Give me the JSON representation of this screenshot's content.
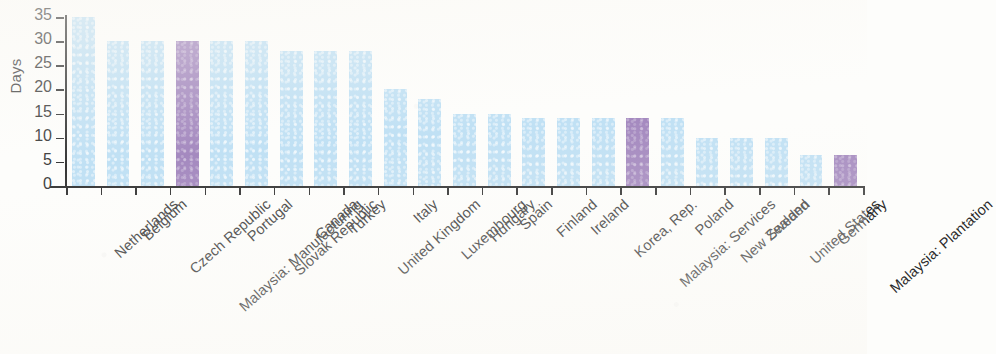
{
  "chart_data": {
    "type": "bar",
    "title": "",
    "subtitle": "",
    "xlabel": "",
    "ylabel": "Days",
    "ylim": [
      0,
      35
    ],
    "yticks": [
      0,
      5,
      10,
      15,
      20,
      25,
      30,
      35
    ],
    "ytick_labels": [
      "0",
      "5",
      "10",
      "15",
      "20",
      "25",
      "30",
      "35"
    ],
    "grid": false,
    "legend": "none",
    "categories": [
      "Netherlands",
      "Belgium",
      "Czech Republic",
      "Malaysia: Manufacturing",
      "Portugal",
      "Slovak Republic",
      "Canada",
      "Turkey",
      "United Kingdom",
      "Italy",
      "Luxembourg",
      "Hungary",
      "Spain",
      "Finland",
      "Ireland",
      "Korea, Rep.",
      "Malaysia: Services",
      "Poland",
      "New Zealand",
      "Sweden",
      "United States",
      "Germany",
      "Malaysia: Plantation"
    ],
    "values": [
      35,
      30,
      30,
      30,
      30,
      30,
      28,
      28,
      28,
      20,
      18,
      15,
      15,
      14,
      14,
      14,
      14,
      14,
      10,
      10,
      10,
      6.5,
      6.5
    ],
    "bar_colors": [
      "blue",
      "blue",
      "blue",
      "purple",
      "blue",
      "blue",
      "blue",
      "blue",
      "blue",
      "blue",
      "blue",
      "blue",
      "blue",
      "blue",
      "blue",
      "blue",
      "purple",
      "blue",
      "blue",
      "blue",
      "blue",
      "blue",
      "purple"
    ]
  },
  "colors": {
    "bar_blue": "#b9ddf3",
    "bar_purple": "#9a7cb8",
    "axis": "#1f1f1f",
    "text": "#2a2a2a",
    "background": "#fdfdfb"
  }
}
